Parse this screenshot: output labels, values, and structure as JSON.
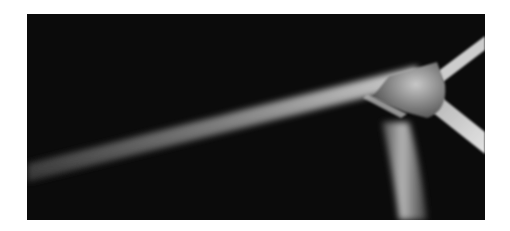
{
  "image": {
    "subject": "Close-up of wind turbine hub with three blades against black background",
    "alt": "Wind turbine blades and nacelle hub, black and white photograph",
    "colors": {
      "background": "#ffffff",
      "photo_background": "#0b0b0b",
      "blade_highlight": "#d8d8d8",
      "blade_mid": "#8a8a8a",
      "hub": "#9a9a9a"
    }
  }
}
